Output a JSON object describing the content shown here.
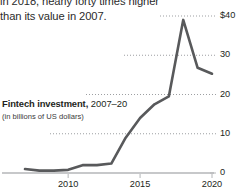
{
  "caption": {
    "lines": [
      "in 2018, nearly forty times higher",
      "than its value in 2007."
    ]
  },
  "chart_title": {
    "main": "Fintech investment,",
    "years": " 2007–20",
    "subtitle": "(in billions of US dollars)"
  },
  "colors": {
    "line": "#58595b",
    "gridline": "#9d9fa2",
    "axis": "#b4b6b8",
    "text": "#231f20"
  },
  "chart_data": {
    "type": "line",
    "title": "Fintech investment, 2007–20",
    "subtitle": "(in billions of US dollars)",
    "xlabel": "",
    "ylabel": "in billions of US dollars",
    "grid": true,
    "legend": "none",
    "xlim": [
      2007,
      2020
    ],
    "ylim": [
      0,
      40
    ],
    "xticks": [
      2010,
      2015,
      2020
    ],
    "xticklabels": [
      "2010",
      "2015",
      "2020"
    ],
    "yticks": [
      0,
      10,
      20,
      30,
      40
    ],
    "yticklabels": [
      "0",
      "10",
      "20",
      "30",
      "$40"
    ],
    "x": [
      2007,
      2008,
      2009,
      2010,
      2011,
      2012,
      2013,
      2014,
      2015,
      2016,
      2017,
      2018,
      2019,
      2020
    ],
    "values": [
      1.0,
      0.6,
      0.6,
      0.8,
      2.0,
      2.0,
      2.4,
      9.0,
      14.0,
      17.5,
      19.5,
      39.0,
      26.8,
      25.3
    ],
    "series": [
      {
        "name": "Fintech investment",
        "values": [
          1.0,
          0.6,
          0.6,
          0.8,
          2.0,
          2.0,
          2.4,
          9.0,
          14.0,
          17.5,
          19.5,
          39.0,
          26.8,
          25.3
        ]
      }
    ]
  }
}
